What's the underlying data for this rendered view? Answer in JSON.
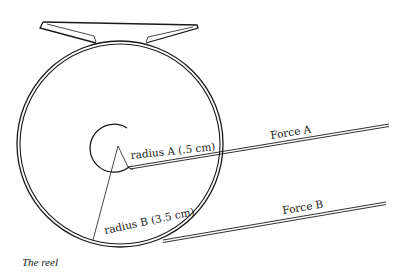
{
  "diagram": {
    "caption": "The reel",
    "labels": {
      "radius_a": "radius A (.5 cm)",
      "radius_b": "radius B (3.5 cm)",
      "force_a": "Force A",
      "force_b": "Force B"
    },
    "components": [
      "reel-foot",
      "reel-outer-rim",
      "inner-spool-arc",
      "radius-a-line",
      "radius-b-line",
      "force-a-line",
      "force-b-line"
    ],
    "values": {
      "radius_a_cm": 0.5,
      "radius_b_cm": 3.5
    },
    "colors": {
      "line": "#1a1a1a",
      "background": "#ffffff"
    }
  }
}
